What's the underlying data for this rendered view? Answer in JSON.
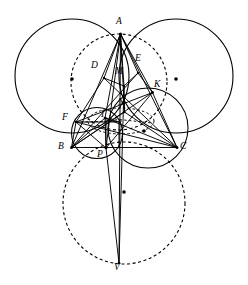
{
  "figure": {
    "width": 248,
    "height": 285,
    "background": "#ffffff",
    "stroke_color": "#000000"
  },
  "points": [
    {
      "id": "A",
      "label": "A",
      "x": 120.5,
      "y": 34.0,
      "label_x": 116.0,
      "label_y": 20.0
    },
    {
      "id": "B",
      "label": "B",
      "x": 71.5,
      "y": 147.5,
      "label_x": 59.0,
      "label_y": 146.0
    },
    {
      "id": "C",
      "label": "C",
      "x": 177.0,
      "y": 147.5,
      "label_x": 180.0,
      "label_y": 146.0
    },
    {
      "id": "D",
      "label": "D",
      "x": 104.0,
      "y": 78.0,
      "label_x": 93.0,
      "label_y": 62.0
    },
    {
      "id": "E",
      "label": "E",
      "x": 138.0,
      "y": 73.0,
      "label_x": 136.0,
      "label_y": 57.0
    },
    {
      "id": "M",
      "label": "M",
      "x": 124.0,
      "y": 86.0,
      "label_x": 116.0,
      "label_y": 68.0
    },
    {
      "id": "K",
      "label": "K",
      "x": 152.5,
      "y": 92.5,
      "label_x": 154.0,
      "label_y": 80.0
    },
    {
      "id": "F",
      "label": "F",
      "x": 76.0,
      "y": 122.0,
      "label_x": 64.0,
      "label_y": 114.0
    },
    {
      "id": "I",
      "label": "I",
      "x": 105.0,
      "y": 118.0,
      "label_x": 100.0,
      "label_y": 110.0
    },
    {
      "id": "N",
      "label": "N",
      "x": 124.5,
      "y": 112.0,
      "label_x": 119.0,
      "label_y": 98.0
    },
    {
      "id": "P",
      "label": "P",
      "x": 106.0,
      "y": 148.0,
      "label_x": 98.0,
      "label_y": 150.0
    },
    {
      "id": "V",
      "label": "V",
      "x": 119.0,
      "y": 265.0,
      "label_x": 114.0,
      "label_y": 264.0
    },
    {
      "id": "T",
      "label": "T",
      "x": 119.0,
      "y": 122.0,
      "label_x": 119.0,
      "label_y": 117.0
    }
  ],
  "circles": [
    {
      "id": "left-large-circle",
      "name": "solid-left-circle",
      "cx": 72.0,
      "cy": 76.0,
      "r": 57.0,
      "dash": "none",
      "center_dot": false
    },
    {
      "id": "right-large-circle",
      "name": "solid-right-circle",
      "cx": 176.0,
      "cy": 76.0,
      "r": 57.0,
      "dash": "none",
      "center_dot": false
    },
    {
      "id": "upper-dashed-circle",
      "name": "dashed-upper-circle",
      "cx": 103.5,
      "cy": 79.0,
      "r": 46.0,
      "dash": "3 2.5",
      "center_dot": true,
      "dot_x": 72.0,
      "dot_y": 79.0
    },
    {
      "id": "left-center-dot",
      "name": "left-circle-center-dot",
      "cx": 72.0,
      "cy": 79.0,
      "r": 0,
      "dash": "none",
      "center_dot": true,
      "dot_x": 72.0,
      "dot_y": 79.0
    },
    {
      "id": "right-center-dot",
      "name": "right-circle-center-dot",
      "cx": 176.0,
      "cy": 79.0,
      "r": 0,
      "dash": "none",
      "center_dot": true,
      "dot_x": 176.0,
      "dot_y": 79.0
    },
    {
      "id": "lower-dashed-circle",
      "name": "dashed-lower-circle",
      "cx": 124.0,
      "cy": 204.0,
      "r": 61.0,
      "dash": "3 2.5",
      "center_dot": true,
      "dot_x": 124.0,
      "dot_y": 192.0
    },
    {
      "id": "circumcircle-bkc",
      "name": "solid-right-small-circle",
      "cx": 148.0,
      "cy": 128.0,
      "r": 40.0,
      "dash": "none",
      "center_dot": true,
      "dot_x": 148.0,
      "dot_y": 128.0
    },
    {
      "id": "incircle-bfp",
      "name": "solid-incircle",
      "cx": 96.5,
      "cy": 133.0,
      "r": 25.5,
      "dash": "none",
      "center_dot": false
    },
    {
      "id": "dashed-small-ellipse",
      "name": "dashed-small-arc",
      "cx": 122.0,
      "cy": 124.0,
      "r": 32.0,
      "dash": "2.5 2",
      "center_dot": false
    }
  ],
  "segments": [
    {
      "name": "side-BC",
      "from": "B",
      "to": "C",
      "dash": "none"
    },
    {
      "name": "side-AB",
      "from": "A",
      "to": "B",
      "dash": "none"
    },
    {
      "name": "side-AC",
      "from": "A",
      "to": "C",
      "dash": "none"
    },
    {
      "name": "cevian-AP",
      "from": "A",
      "to": "P",
      "dash": "none"
    },
    {
      "name": "cevian-AV",
      "from": "A",
      "to": "V",
      "dash": "none"
    },
    {
      "name": "segment-PV",
      "from": "P",
      "to": "V",
      "dash": "none"
    },
    {
      "name": "segment-AD",
      "from": "A",
      "to": "D",
      "dash": "none"
    },
    {
      "name": "segment-AE",
      "from": "A",
      "to": "E",
      "dash": "none"
    },
    {
      "name": "segment-AK",
      "from": "A",
      "to": "K",
      "dash": "none"
    },
    {
      "name": "segment-AM",
      "from": "A",
      "to": "M",
      "dash": "none"
    },
    {
      "name": "segment-AN",
      "from": "A",
      "to": "N",
      "dash": "none"
    },
    {
      "name": "segment-AI",
      "from": "A",
      "to": "I",
      "dash": "none"
    },
    {
      "name": "segment-DM",
      "from": "D",
      "to": "M",
      "dash": "none"
    },
    {
      "name": "segment-EM",
      "from": "E",
      "to": "M",
      "dash": "none"
    },
    {
      "name": "segment-DF",
      "from": "D",
      "to": "F",
      "dash": "none"
    },
    {
      "name": "segment-DC",
      "from": "D",
      "to": "C",
      "dash": "none"
    },
    {
      "name": "segment-EK",
      "from": "E",
      "to": "K",
      "dash": "none"
    },
    {
      "name": "segment-EB",
      "from": "E",
      "to": "B",
      "dash": "none"
    },
    {
      "name": "segment-KB",
      "from": "K",
      "to": "B",
      "dash": "none"
    },
    {
      "name": "segment-KC",
      "from": "K",
      "to": "C",
      "dash": "none"
    },
    {
      "name": "segment-KF",
      "from": "K",
      "to": "F",
      "dash": "none"
    },
    {
      "name": "segment-KP",
      "from": "K",
      "to": "P",
      "dash": "none"
    },
    {
      "name": "segment-FB",
      "from": "F",
      "to": "B",
      "dash": "none"
    },
    {
      "name": "segment-FC",
      "from": "F",
      "to": "C",
      "dash": "none"
    },
    {
      "name": "segment-FP",
      "from": "F",
      "to": "P",
      "dash": "none"
    },
    {
      "name": "segment-BI",
      "from": "B",
      "to": "I",
      "dash": "none"
    },
    {
      "name": "segment-IC",
      "from": "I",
      "to": "C",
      "dash": "none"
    },
    {
      "name": "segment-IP",
      "from": "I",
      "to": "P",
      "dash": "none"
    },
    {
      "name": "segment-MN",
      "from": "M",
      "to": "N",
      "dash": "none"
    },
    {
      "name": "segment-NB",
      "from": "N",
      "to": "B",
      "dash": "none"
    },
    {
      "name": "segment-NC",
      "from": "N",
      "to": "C",
      "dash": "none"
    },
    {
      "name": "segment-MV",
      "from": "M",
      "to": "V",
      "dash": "none"
    },
    {
      "name": "segment-TI",
      "from": "T",
      "to": "I",
      "dash": "none"
    },
    {
      "name": "segment-FT",
      "from": "F",
      "to": "T",
      "dash": "none"
    },
    {
      "name": "segment-TP",
      "from": "T",
      "to": "P",
      "dash": "none"
    },
    {
      "name": "segment-IN-dashed",
      "from": "I",
      "to": "N",
      "dash": "2.5 2"
    },
    {
      "name": "segment-FI-dashed",
      "from": "F",
      "to": "I",
      "dash": "2.5 2"
    }
  ],
  "labels": {
    "A": "A",
    "B": "B",
    "C": "C",
    "D": "D",
    "E": "E",
    "M": "M",
    "K": "K",
    "F": "F",
    "I": "I",
    "N": "N",
    "P": "P",
    "V": "V",
    "T": "T"
  }
}
